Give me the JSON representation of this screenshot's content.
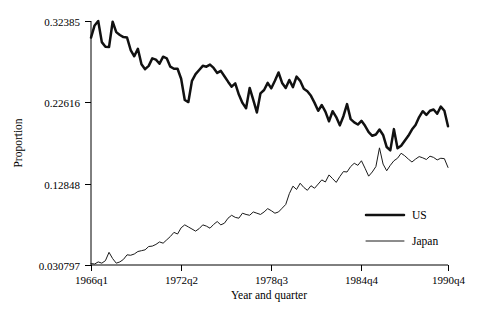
{
  "chart_data": {
    "type": "line",
    "title": "",
    "xlabel": "Year and quarter",
    "ylabel": "Proportion",
    "grid": false,
    "legend_position": "inside-right",
    "xlim": [
      0,
      99
    ],
    "ylim": [
      0.030797,
      0.32385
    ],
    "ytick_labels": [
      "0.32385",
      "0.22616",
      "0.12848",
      "0.030797"
    ],
    "ytick_values": [
      0.32385,
      0.22616,
      0.12848,
      0.030797
    ],
    "xtick_labels": [
      "1966q1",
      "1972q2",
      "1978q3",
      "1984q4",
      "1990q4"
    ],
    "xtick_indices": [
      0,
      25,
      50,
      75,
      99
    ],
    "series": [
      {
        "name": "US",
        "style": "thick",
        "values": [
          0.304,
          0.3185,
          0.3238,
          0.2985,
          0.293,
          0.2925,
          0.323,
          0.3105,
          0.307,
          0.3045,
          0.304,
          0.289,
          0.2815,
          0.2905,
          0.272,
          0.266,
          0.27,
          0.279,
          0.2775,
          0.2725,
          0.281,
          0.279,
          0.269,
          0.2665,
          0.2665,
          0.2545,
          0.229,
          0.2265,
          0.252,
          0.26,
          0.265,
          0.27,
          0.269,
          0.2715,
          0.2675,
          0.2615,
          0.264,
          0.2575,
          0.251,
          0.245,
          0.249,
          0.2355,
          0.2255,
          0.219,
          0.2435,
          0.229,
          0.214,
          0.237,
          0.241,
          0.2495,
          0.243,
          0.252,
          0.262,
          0.2495,
          0.2435,
          0.253,
          0.2445,
          0.257,
          0.252,
          0.2425,
          0.2395,
          0.234,
          0.2255,
          0.216,
          0.223,
          0.215,
          0.2035,
          0.2155,
          0.2085,
          0.1985,
          0.2095,
          0.224,
          0.206,
          0.202,
          0.1995,
          0.204,
          0.198,
          0.1905,
          0.186,
          0.1875,
          0.1935,
          0.187,
          0.1725,
          0.1685,
          0.194,
          0.171,
          0.174,
          0.18,
          0.186,
          0.1935,
          0.199,
          0.2085,
          0.2155,
          0.211,
          0.216,
          0.2175,
          0.2125,
          0.221,
          0.216,
          0.1975
        ]
      },
      {
        "name": "Japan",
        "style": "thin",
        "values": [
          0.0325,
          0.032,
          0.0345,
          0.033,
          0.036,
          0.046,
          0.0385,
          0.033,
          0.0345,
          0.0375,
          0.043,
          0.0425,
          0.044,
          0.047,
          0.048,
          0.049,
          0.053,
          0.0535,
          0.0555,
          0.0585,
          0.057,
          0.061,
          0.065,
          0.07,
          0.068,
          0.0755,
          0.079,
          0.0765,
          0.074,
          0.0715,
          0.0745,
          0.079,
          0.0775,
          0.075,
          0.0795,
          0.083,
          0.079,
          0.081,
          0.087,
          0.0905,
          0.088,
          0.087,
          0.093,
          0.0915,
          0.0905,
          0.0945,
          0.093,
          0.0915,
          0.0945,
          0.0985,
          0.096,
          0.093,
          0.0945,
          0.099,
          0.1035,
          0.1165,
          0.1255,
          0.1215,
          0.129,
          0.124,
          0.1205,
          0.126,
          0.123,
          0.128,
          0.133,
          0.1305,
          0.139,
          0.1345,
          0.13,
          0.137,
          0.143,
          0.1425,
          0.149,
          0.153,
          0.1505,
          0.156,
          0.147,
          0.1375,
          0.1425,
          0.149,
          0.1715,
          0.152,
          0.144,
          0.1505,
          0.156,
          0.159,
          0.165,
          0.162,
          0.158,
          0.1545,
          0.158,
          0.161,
          0.1595,
          0.1575,
          0.1615,
          0.16,
          0.157,
          0.159,
          0.1585,
          0.148
        ]
      }
    ]
  },
  "legend": {
    "items": [
      {
        "label": "US"
      },
      {
        "label": "Japan"
      }
    ]
  },
  "colors": {
    "us_line": "#111111",
    "japan_line": "#1a1a1a",
    "axis": "#000000",
    "background": "#ffffff"
  }
}
